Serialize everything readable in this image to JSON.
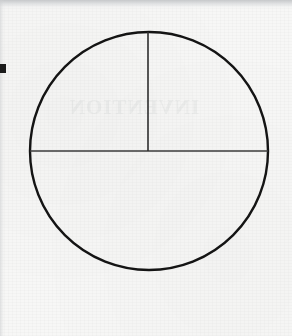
{
  "page": {
    "width": 292,
    "height": 336,
    "background_color": "#f7f7f6",
    "medium": "scanned-paper"
  },
  "artifacts": {
    "top_scan_band_color": "#c4c6c8",
    "edge_mark": {
      "name": "left-margin-registration-mark",
      "color": "#1b1b1b",
      "x": 0,
      "y": 64,
      "width": 6,
      "height": 9
    },
    "ghost_text": "INVENTION",
    "ghost_text_note": "faint bleed-through from reverse side of page"
  },
  "figure": {
    "type": "circle-fraction-diagram",
    "stroke_color": "#141414",
    "line_color": "#3a3a3a",
    "fill_color": "none",
    "circle": {
      "name": "outer-circle",
      "center_x": 149,
      "center_y": 151,
      "radius": 119,
      "stroke_width": 2.4
    },
    "lines": [
      {
        "name": "horizontal-diameter",
        "x1": 30,
        "y1": 151,
        "x2": 268,
        "y2": 151,
        "stroke_width": 1.3,
        "orientation": "horizontal"
      },
      {
        "name": "vertical-radius-upper",
        "x1": 148,
        "y1": 32,
        "x2": 148,
        "y2": 151,
        "stroke_width": 1.6,
        "orientation": "vertical"
      }
    ],
    "regions": [
      {
        "name": "upper-left-quarter",
        "fraction": "1/4"
      },
      {
        "name": "upper-right-quarter",
        "fraction": "1/4"
      },
      {
        "name": "lower-half",
        "fraction": "1/2"
      }
    ]
  }
}
